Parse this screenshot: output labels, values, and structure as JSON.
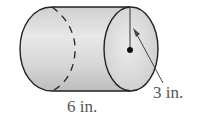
{
  "diagram": {
    "shape": "cylinder",
    "labels": {
      "length": "6 in.",
      "radius": "3 in."
    },
    "colors": {
      "outline": "#222222",
      "fill_light": "#e6e6e6",
      "fill_dark": "#bdbdbd",
      "label": "#555555"
    }
  }
}
